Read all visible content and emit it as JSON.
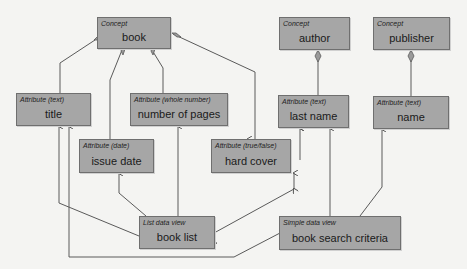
{
  "diagram": {
    "concepts": [
      {
        "id": "book",
        "kind": "Concept",
        "label": "book"
      },
      {
        "id": "author",
        "kind": "Concept",
        "label": "author"
      },
      {
        "id": "publisher",
        "kind": "Concept",
        "label": "publisher"
      }
    ],
    "attributes": [
      {
        "id": "title",
        "kind": "Attribute (text)",
        "label": "title"
      },
      {
        "id": "pages",
        "kind": "Attribute (whole number)",
        "label": "number of pages"
      },
      {
        "id": "issue",
        "kind": "Attribute (date)",
        "label": "issue date"
      },
      {
        "id": "hardcover",
        "kind": "Attribute (true/false)",
        "label": "hard cover"
      },
      {
        "id": "lastname",
        "kind": "Attribute (text)",
        "label": "last name"
      },
      {
        "id": "pubname",
        "kind": "Attribute (text)",
        "label": "name"
      }
    ],
    "views": [
      {
        "id": "booklist",
        "kind": "List data view",
        "label": "book list"
      },
      {
        "id": "search",
        "kind": "Simple data view",
        "label": "book search criteria"
      }
    ],
    "compositions": [
      {
        "from": "book",
        "to": "title"
      },
      {
        "from": "book",
        "to": "issue date"
      },
      {
        "from": "book",
        "to": "number of pages"
      },
      {
        "from": "book",
        "to": "hard cover"
      },
      {
        "from": "author",
        "to": "last name"
      },
      {
        "from": "publisher",
        "to": "name"
      }
    ],
    "references": [
      {
        "from": "book list",
        "to": "title"
      },
      {
        "from": "book list",
        "to": "issue date"
      },
      {
        "from": "book list",
        "to": "number of pages"
      },
      {
        "from": "book list",
        "to": "hard cover"
      },
      {
        "from": "book list",
        "to": "last name"
      },
      {
        "from": "book search criteria",
        "to": "title"
      },
      {
        "from": "book search criteria",
        "to": "last name"
      },
      {
        "from": "book search criteria",
        "to": "name"
      }
    ],
    "colors": {
      "box_fill": "#a6a6a6",
      "box_border": "#6f6f6f",
      "line": "#555555",
      "background": "#f4f4f2"
    }
  }
}
